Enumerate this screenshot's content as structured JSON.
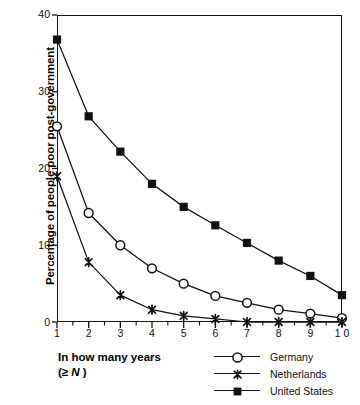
{
  "chart_data": {
    "type": "line",
    "title": "",
    "xlabel": "In how many years (≥ N )",
    "ylabel": "Percentage of people poor post-government",
    "x": [
      1,
      2,
      3,
      4,
      5,
      6,
      7,
      8,
      9,
      10
    ],
    "xticklabels": [
      "1",
      "2",
      "3",
      "4",
      "5",
      "6",
      "7",
      "8",
      "9",
      "1 0"
    ],
    "yticklabels": [
      "0",
      "10",
      "20",
      "30",
      "40"
    ],
    "yticks": [
      0,
      10,
      20,
      30,
      40
    ],
    "xlim": [
      1,
      10
    ],
    "ylim": [
      0,
      40
    ],
    "grid": false,
    "legend_position": "bottom-right",
    "series": [
      {
        "name": "Germany",
        "marker": "open-circle",
        "color": "#111111",
        "values": [
          25.5,
          14.2,
          10.0,
          7.0,
          5.0,
          3.4,
          2.5,
          1.6,
          1.1,
          0.5
        ]
      },
      {
        "name": "Netherlands",
        "marker": "cross-x",
        "color": "#111111",
        "values": [
          19.0,
          7.8,
          3.5,
          1.6,
          0.8,
          0.4,
          0.0,
          0.0,
          0.0,
          0.0
        ]
      },
      {
        "name": "United States",
        "marker": "filled-square",
        "color": "#111111",
        "values": [
          36.8,
          26.8,
          22.2,
          18.0,
          15.0,
          12.6,
          10.3,
          8.0,
          6.0,
          3.5
        ]
      }
    ]
  },
  "axis": {
    "y_title": "Percentage of people poor post-government",
    "x_title_line1": "In how many years",
    "x_title_line2_pre": "(≥ ",
    "x_title_line2_var": "N",
    "x_title_line2_post": " )"
  },
  "legend": {
    "items": [
      {
        "label": "Germany",
        "marker": "open-circle"
      },
      {
        "label": "Netherlands",
        "marker": "cross-x"
      },
      {
        "label": "United States",
        "marker": "filled-square"
      }
    ]
  }
}
